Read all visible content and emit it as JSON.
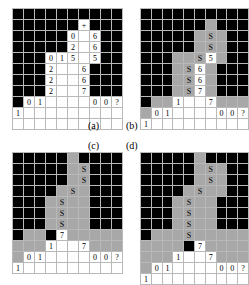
{
  "figure": {
    "type": "grid-diagram",
    "panel_count": 4,
    "captions": [
      {
        "id": "a",
        "label": "(a)",
        "x": 88,
        "y": 120
      },
      {
        "id": "b",
        "label": "(b)",
        "x": 126,
        "y": 120
      },
      {
        "id": "c",
        "label": "(c)",
        "x": 88,
        "y": 140
      },
      {
        "id": "d",
        "label": "(d)",
        "x": 126,
        "y": 140
      }
    ],
    "legend": {
      "black_cell": "#000000",
      "gray_cell": "#a8a8a8",
      "white_cell": "#ffffff",
      "grid_line": "#b9b9b9"
    },
    "symbols": {
      "plus": "+",
      "marker": "S",
      "unknown": "?"
    }
  },
  "panels": [
    {
      "id": "a",
      "caption": "(a)",
      "cols": 10,
      "rows": 11,
      "cells": [
        [
          "k",
          "k",
          "k",
          "k",
          "k",
          "k",
          "k",
          "k",
          "k",
          "k"
        ],
        [
          "k",
          "k",
          "k",
          "k",
          "k",
          "k",
          "+",
          "k",
          "k",
          "k"
        ],
        [
          "k",
          "k",
          "k",
          "k",
          "k",
          "0",
          "w",
          "6",
          "k",
          "k"
        ],
        [
          "k",
          "k",
          "k",
          "k",
          "k",
          "2",
          "w",
          "6",
          "k",
          "k"
        ],
        [
          "k",
          "k",
          "k",
          "0",
          "1",
          "5",
          "w",
          "5",
          "k",
          "k"
        ],
        [
          "k",
          "k",
          "k",
          "2",
          "w",
          "w",
          "6",
          "k",
          "k",
          "k"
        ],
        [
          "k",
          "k",
          "k",
          "2",
          "w",
          "w",
          "6",
          "k",
          "k",
          "k"
        ],
        [
          "k",
          "k",
          "k",
          "2",
          "w",
          "w",
          "7",
          "k",
          "k",
          "k"
        ],
        [
          "k",
          "0",
          "1",
          "w",
          "w",
          "w",
          "w",
          "0",
          "0",
          "?"
        ],
        [
          "1",
          "w",
          "w",
          "w",
          "w",
          "w",
          "w",
          "w",
          "w",
          "w"
        ],
        [
          "w",
          "w",
          "w",
          "w",
          "w",
          "w",
          "w",
          "w",
          "w",
          "w"
        ]
      ]
    },
    {
      "id": "b",
      "caption": "(b)",
      "cols": 10,
      "rows": 11,
      "cells": [
        [
          "k",
          "k",
          "k",
          "k",
          "k",
          "k",
          "k",
          "k",
          "k",
          "k"
        ],
        [
          "k",
          "k",
          "k",
          "k",
          "k",
          "k",
          "g",
          "k",
          "k",
          "k"
        ],
        [
          "k",
          "k",
          "k",
          "k",
          "k",
          "g",
          "S",
          "g",
          "k",
          "k"
        ],
        [
          "k",
          "k",
          "k",
          "k",
          "k",
          "g",
          "S",
          "g",
          "k",
          "k"
        ],
        [
          "k",
          "k",
          "k",
          "g",
          "g",
          "S",
          "5",
          "g",
          "k",
          "k"
        ],
        [
          "k",
          "k",
          "k",
          "g",
          "S",
          "6",
          "g",
          "k",
          "k",
          "k"
        ],
        [
          "k",
          "k",
          "k",
          "g",
          "S",
          "6",
          "g",
          "k",
          "k",
          "k"
        ],
        [
          "k",
          "k",
          "k",
          "g",
          "S",
          "7",
          "g",
          "k",
          "k",
          "k"
        ],
        [
          "k",
          "g",
          "g",
          "1",
          "w",
          "w",
          "7",
          "g",
          "g",
          "g"
        ],
        [
          "g",
          "0",
          "1",
          "w",
          "w",
          "w",
          "w",
          "0",
          "0",
          "?"
        ],
        [
          "1",
          "w",
          "w",
          "w",
          "w",
          "w",
          "w",
          "w",
          "w",
          "w"
        ]
      ]
    },
    {
      "id": "c",
      "caption": "(c)",
      "cols": 10,
      "rows": 11,
      "cells": [
        [
          "k",
          "k",
          "k",
          "k",
          "k",
          "g",
          "k",
          "k",
          "k",
          "k"
        ],
        [
          "k",
          "k",
          "k",
          "k",
          "k",
          "g",
          "S",
          "k",
          "k",
          "k"
        ],
        [
          "k",
          "k",
          "k",
          "k",
          "k",
          "g",
          "S",
          "k",
          "k",
          "k"
        ],
        [
          "k",
          "k",
          "k",
          "k",
          "g",
          "S",
          "g",
          "k",
          "k",
          "k"
        ],
        [
          "k",
          "k",
          "k",
          "g",
          "S",
          "g",
          "g",
          "k",
          "k",
          "k"
        ],
        [
          "k",
          "k",
          "k",
          "g",
          "S",
          "g",
          "g",
          "k",
          "k",
          "k"
        ],
        [
          "k",
          "k",
          "k",
          "g",
          "S",
          "g",
          "g",
          "k",
          "k",
          "k"
        ],
        [
          "k",
          "g",
          "g",
          "Sk",
          "7",
          "g",
          "g",
          "g",
          "g",
          "g"
        ],
        [
          "g",
          "g",
          "g",
          "1",
          "w",
          "w",
          "7",
          "g",
          "g",
          "g"
        ],
        [
          "g",
          "0",
          "1",
          "w",
          "w",
          "w",
          "w",
          "0",
          "0",
          "?"
        ],
        [
          "1",
          "w",
          "w",
          "w",
          "w",
          "w",
          "w",
          "w",
          "w",
          "w"
        ]
      ]
    },
    {
      "id": "d",
      "caption": "(d)",
      "cols": 10,
      "rows": 11,
      "cells": [
        [
          "k",
          "k",
          "k",
          "k",
          "k",
          "g",
          "k",
          "k",
          "k",
          "k"
        ],
        [
          "k",
          "k",
          "k",
          "k",
          "k",
          "g",
          "S",
          "g",
          "k",
          "k"
        ],
        [
          "k",
          "k",
          "k",
          "k",
          "k",
          "g",
          "S",
          "g",
          "k",
          "k"
        ],
        [
          "k",
          "k",
          "k",
          "k",
          "g",
          "S",
          "g",
          "g",
          "k",
          "k"
        ],
        [
          "k",
          "k",
          "k",
          "g",
          "S",
          "g",
          "g",
          "k",
          "k",
          "k"
        ],
        [
          "k",
          "k",
          "k",
          "g",
          "S",
          "g",
          "g",
          "k",
          "k",
          "k"
        ],
        [
          "k",
          "k",
          "k",
          "g",
          "S",
          "g",
          "g",
          "k",
          "k",
          "k"
        ],
        [
          "k",
          "g",
          "g",
          "g",
          "S",
          "g",
          "g",
          "g",
          "g",
          "g"
        ],
        [
          "g",
          "g",
          "g",
          "g",
          "k",
          "7",
          "g",
          "g",
          "g",
          "g"
        ],
        [
          "g",
          "g",
          "g",
          "1",
          "w",
          "w",
          "7",
          "g",
          "g",
          "g"
        ],
        [
          "g",
          "0",
          "1",
          "w",
          "w",
          "w",
          "w",
          "0",
          "0",
          "?"
        ],
        [
          "1",
          "w",
          "w",
          "w",
          "w",
          "w",
          "w",
          "w",
          "w",
          "w"
        ]
      ]
    }
  ]
}
